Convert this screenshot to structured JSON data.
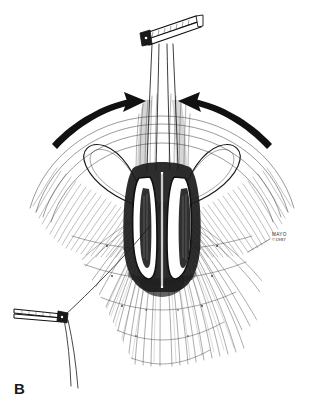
{
  "figure": {
    "panel_label": "B",
    "domain": "medical-surgical-illustration",
    "technique": "pen-and-ink line drawing with hatching",
    "background_color": "#ffffff",
    "ink_color": "#1a1a1a",
    "width": 324,
    "height": 411
  },
  "credit": {
    "name": "MAYO",
    "copyright": "©1987"
  },
  "scene": {
    "title": "Surgical field with tissue approximation",
    "description": "Anatomic surgical site shown from above with a central vertical slit-like opening flanked by two elongated oval tissue edges, radiating fascial fibers fanning outward, retraction sutures held by hemostatic clamps, and paired curved arrows indicating approximation of the tissue edges toward the midline."
  },
  "elements": {
    "top_clamp": {
      "name": "Hemostat clamp (upper)",
      "label": "upper-forceps",
      "orientation": "angled upward to the right",
      "holds": "vertical suture strands"
    },
    "left_clamp": {
      "name": "Hemostat clamp (lower left)",
      "label": "lower-left-forceps",
      "orientation": "horizontal at left margin",
      "holds": "traction suture strands"
    },
    "suture_strands_vertical": {
      "name": "Vertical suture strands",
      "count": 4,
      "description": "Parallel strands running from the clamp down into the central opening"
    },
    "suture_loops": {
      "name": "Lateral suture loops",
      "count": 2,
      "description": "Large symmetric teardrop loops of suture extending laterally left and right from the central structure"
    },
    "central_structure": {
      "name": "Central tissue edges",
      "description": "Two elongated white oval tissue edges outlined in heavy ink, separated by a midline slit"
    },
    "arrows": [
      {
        "name": "left-approximation-arrow",
        "direction": "pointing right toward midline",
        "meaning": "tissue drawn medially"
      },
      {
        "name": "right-approximation-arrow",
        "direction": "pointing left toward midline",
        "meaning": "tissue drawn medially"
      }
    ],
    "fascial_fibers": {
      "name": "Radiating fascial/muscle fibers",
      "description": "Dense fan of fine hatched lines converging toward the midline from the surrounding tissue dome"
    },
    "tissue_dome": {
      "name": "Surrounding tissue surface",
      "description": "Broad arcing contour lines forming a dome that frames the operative field"
    }
  }
}
